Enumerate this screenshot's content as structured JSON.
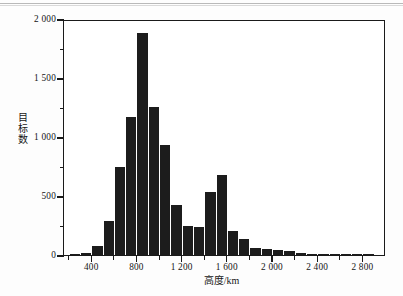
{
  "chart_data": {
    "type": "bar",
    "title": "",
    "subtitle": "",
    "xlabel": "高度/km",
    "ylabel": "目标数",
    "xlim": [
      150,
      3000
    ],
    "ylim": [
      0,
      2000
    ],
    "grid": false,
    "legend": null,
    "bin_width": 100,
    "x_tick_labels": [
      "400",
      "800",
      "1 200",
      "1 600",
      "2 000",
      "2 400",
      "2 800"
    ],
    "x_tick_values": [
      400,
      800,
      1200,
      1600,
      2000,
      2400,
      2800
    ],
    "x_minor_tick_values": [
      200,
      600,
      1000,
      1400,
      1800,
      2200,
      2600
    ],
    "y_tick_labels": [
      "0",
      "500",
      "1 000",
      "1 500",
      "2 000"
    ],
    "y_tick_values": [
      0,
      500,
      1000,
      1500,
      2000
    ],
    "y_minor_tick_values": [
      250,
      750,
      1250,
      1750
    ],
    "bar_color": "#1c1c1c",
    "axis_color": "#1a1a1a",
    "background_color": "#ffffff",
    "categories": [
      "200-300",
      "300-400",
      "400-500",
      "500-600",
      "600-700",
      "700-800",
      "800-900",
      "900-1000",
      "1000-1100",
      "1100-1200",
      "1200-1300",
      "1300-1400",
      "1400-1500",
      "1500-1600",
      "1600-1700",
      "1700-1800",
      "1800-1900",
      "1900-2000",
      "2000-2100",
      "2100-2200",
      "2200-2300",
      "2300-2400",
      "2400-2500",
      "2500-2600",
      "2600-2700",
      "2700-2800",
      "2800-2900"
    ],
    "bin_starts": [
      200,
      300,
      400,
      500,
      600,
      700,
      800,
      900,
      1000,
      1100,
      1200,
      1300,
      1400,
      1500,
      1600,
      1700,
      1800,
      1900,
      2000,
      2100,
      2200,
      2300,
      2400,
      2500,
      2600,
      2700,
      2800
    ],
    "values": [
      10,
      20,
      80,
      285,
      745,
      1170,
      1880,
      1255,
      930,
      420,
      250,
      235,
      530,
      680,
      200,
      135,
      60,
      50,
      45,
      35,
      18,
      10,
      8,
      6,
      5,
      4,
      10
    ]
  },
  "page": {
    "caption": ""
  }
}
